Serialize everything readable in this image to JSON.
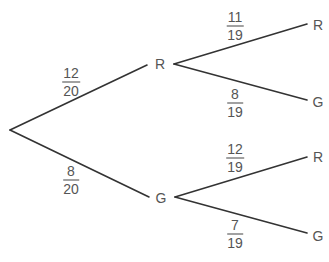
{
  "diagram": {
    "type": "probability-tree",
    "colors": {
      "line": "#333333",
      "text": "#555555",
      "background": "#ffffff"
    },
    "first_draw": [
      {
        "outcome": "R",
        "probability": {
          "numerator": "12",
          "denominator": "20"
        }
      },
      {
        "outcome": "G",
        "probability": {
          "numerator": "8",
          "denominator": "20"
        }
      }
    ],
    "second_draw": {
      "after_R": [
        {
          "outcome": "R",
          "probability": {
            "numerator": "11",
            "denominator": "19"
          }
        },
        {
          "outcome": "G",
          "probability": {
            "numerator": "8",
            "denominator": "19"
          }
        }
      ],
      "after_G": [
        {
          "outcome": "R",
          "probability": {
            "numerator": "12",
            "denominator": "19"
          }
        },
        {
          "outcome": "G",
          "probability": {
            "numerator": "7",
            "denominator": "19"
          }
        }
      ]
    }
  }
}
